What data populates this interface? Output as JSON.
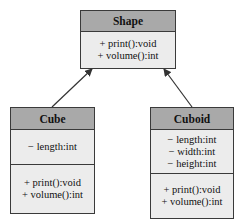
{
  "diagram": {
    "type": "uml-class-diagram",
    "classes": [
      {
        "name": "Shape",
        "attributes": [],
        "methods": [
          "+ print():void",
          "+ volume():int"
        ]
      },
      {
        "name": "Cube",
        "attributes": [
          "− length:int"
        ],
        "methods": [
          "+ print():void",
          "+ volume():int"
        ]
      },
      {
        "name": "Cuboid",
        "attributes": [
          "− length:int",
          "− width:int",
          "− height:int"
        ],
        "methods": [
          "+ print():void",
          "+ volume():int"
        ]
      }
    ],
    "relations": [
      {
        "from": "Cube",
        "to": "Shape",
        "type": "inheritance-arrow"
      },
      {
        "from": "Cuboid",
        "to": "Shape",
        "type": "inheritance-arrow"
      }
    ],
    "colors": {
      "header_fill": "#a9a9a9",
      "body_fill": "#ececec",
      "border": "#3a3a3a",
      "arrow": "#333333"
    }
  }
}
